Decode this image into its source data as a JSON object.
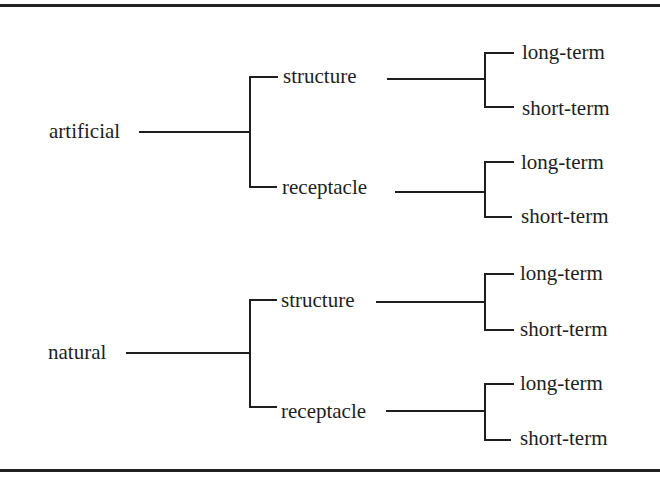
{
  "diagram": {
    "type": "tree",
    "orientation": "left-to-right",
    "roots": [
      {
        "label": "artificial",
        "children": [
          {
            "label": "structure",
            "children": [
              {
                "label": "long-term"
              },
              {
                "label": "short-term"
              }
            ]
          },
          {
            "label": "receptacle",
            "children": [
              {
                "label": "long-term"
              },
              {
                "label": "short-term"
              }
            ]
          }
        ]
      },
      {
        "label": "natural",
        "children": [
          {
            "label": "structure",
            "children": [
              {
                "label": "long-term"
              },
              {
                "label": "short-term"
              }
            ]
          },
          {
            "label": "receptacle",
            "children": [
              {
                "label": "long-term"
              },
              {
                "label": "short-term"
              }
            ]
          }
        ]
      }
    ]
  },
  "colors": {
    "ink": "#1e1e1e",
    "background": "#ffffff",
    "rule": "#222222"
  }
}
